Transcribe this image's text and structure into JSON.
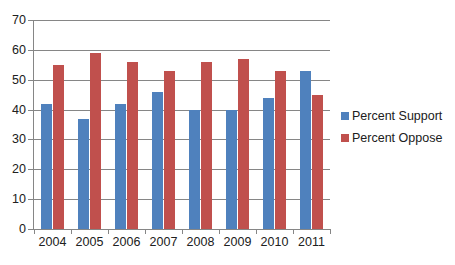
{
  "chart_data": {
    "type": "bar",
    "title": "",
    "subtitle": "",
    "xlabel": "",
    "ylabel": "",
    "categories": [
      "2004",
      "2005",
      "2006",
      "2007",
      "2008",
      "2009",
      "2010",
      "2011"
    ],
    "series": [
      {
        "name": "Percent Support",
        "color": "#4F81BD",
        "values": [
          42,
          37,
          42,
          46,
          40,
          40,
          44,
          53
        ]
      },
      {
        "name": "Percent Oppose",
        "color": "#C0504D",
        "values": [
          55,
          59,
          56,
          53,
          56,
          57,
          53,
          45
        ]
      }
    ],
    "ylim": [
      0,
      70
    ],
    "ytick_step": 10,
    "yticks": [
      "0",
      "10",
      "20",
      "30",
      "40",
      "50",
      "60",
      "70"
    ],
    "grid": "horizontal",
    "legend_position": "right",
    "annotations": []
  },
  "legend": {
    "items": [
      {
        "label": "Percent Support"
      },
      {
        "label": "Percent Oppose"
      }
    ]
  }
}
